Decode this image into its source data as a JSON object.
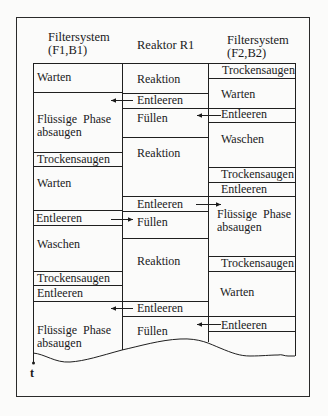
{
  "headers": {
    "left": [
      "Filtersystem",
      "(F1,B1)"
    ],
    "middle": "Reaktor R1",
    "right": [
      "Filtersystem",
      "(F2,B2)"
    ]
  },
  "columns": {
    "left": [
      {
        "label": "Warten",
        "top": 63,
        "bottom": 92
      },
      {
        "label": "Flüssige  Phase\nabsaugen",
        "line1": "Flüssige  Phase",
        "line2": "absaugen",
        "top": 92,
        "bottom": 152
      },
      {
        "label": "Trockensaugen",
        "top": 152,
        "bottom": 166
      },
      {
        "label": "Warten",
        "top": 166,
        "bottom": 210
      },
      {
        "label": "Entleeren",
        "top": 210,
        "bottom": 225
      },
      {
        "label": "Waschen",
        "top": 225,
        "bottom": 271
      },
      {
        "label": "Trockensaugen",
        "top": 271,
        "bottom": 285
      },
      {
        "label": "Entleeren",
        "top": 285,
        "bottom": 301
      },
      {
        "label": "Flüssige  Phase\nabsaugen",
        "line1": "Flüssige  Phase",
        "line2": "absaugen",
        "top": 301,
        "bottom": 352
      }
    ],
    "middle": [
      {
        "label": "Reaktion",
        "top": 63,
        "bottom": 93
      },
      {
        "label": "Entleeren",
        "top": 93,
        "bottom": 108
      },
      {
        "label": "Füllen",
        "top": 108,
        "bottom": 137
      },
      {
        "label": "Reaktion",
        "top": 137,
        "bottom": 196
      },
      {
        "label": "Entleeren",
        "top": 196,
        "bottom": 211
      },
      {
        "label": "Füllen",
        "top": 211,
        "bottom": 238
      },
      {
        "label": "Reaktion",
        "top": 238,
        "bottom": 300
      },
      {
        "label": "Entleeren",
        "top": 300,
        "bottom": 316
      },
      {
        "label": "Füllen",
        "top": 316,
        "bottom": 350
      }
    ],
    "right": [
      {
        "label": "Trockensaugen",
        "top": 63,
        "bottom": 78
      },
      {
        "label": "Warten",
        "top": 78,
        "bottom": 108
      },
      {
        "label": "Entleeren",
        "top": 108,
        "bottom": 122
      },
      {
        "label": "Waschen",
        "top": 122,
        "bottom": 167
      },
      {
        "label": "Trockensaugen",
        "top": 167,
        "bottom": 182
      },
      {
        "label": "Entleeren",
        "top": 182,
        "bottom": 196
      },
      {
        "label": "Flüssige  Phase\nabsaugen",
        "line1": "Flüssige  Phase",
        "line2": "absaugen",
        "top": 196,
        "bottom": 256
      },
      {
        "label": "Trockensaugen",
        "top": 256,
        "bottom": 271
      },
      {
        "label": "Warten",
        "top": 271,
        "bottom": 316
      },
      {
        "label": "Entleeren",
        "top": 316,
        "bottom": 331
      },
      {
        "label": "",
        "top": 331,
        "bottom": 355
      }
    ]
  },
  "arrows": [
    {
      "from": "Reaktor R1: Entleeren",
      "to": "Filtersystem (F1,B1)",
      "direction": "left",
      "y": 100
    },
    {
      "from": "Filtersystem (F2,B2): Entleeren",
      "to": "Reaktor R1: Füllen",
      "direction": "left",
      "y": 115
    },
    {
      "from": "Reaktor R1: Entleeren",
      "to": "Filtersystem (F2,B2)",
      "direction": "right",
      "y": 204
    },
    {
      "from": "Filtersystem (F1,B1): Entleeren",
      "to": "Reaktor R1: Füllen",
      "direction": "right",
      "y": 219
    },
    {
      "from": "Reaktor R1: Entleeren",
      "to": "Filtersystem (F1,B1)",
      "direction": "left",
      "y": 308
    },
    {
      "from": "Filtersystem (F2,B2): Entleeren",
      "to": "Reaktor R1: Füllen",
      "direction": "left",
      "y": 324
    }
  ],
  "time_axis": {
    "label": "t"
  }
}
